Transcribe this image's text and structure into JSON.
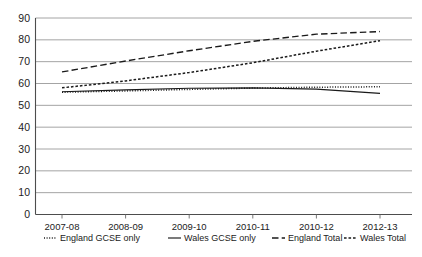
{
  "chart_data": {
    "type": "line",
    "title": "",
    "xlabel": "",
    "ylabel": "",
    "ylim": [
      0,
      90
    ],
    "ytick_step": 10,
    "grid": true,
    "legend_position": "bottom",
    "categories": [
      "2007-08",
      "2008-09",
      "2009-10",
      "2010-11",
      "2010-12",
      "2012-13"
    ],
    "ytick_labels": [
      "90",
      "80",
      "70",
      "60",
      "50",
      "40",
      "30",
      "20",
      "10",
      "0"
    ],
    "ytick_values": [
      90,
      80,
      70,
      60,
      50,
      40,
      30,
      20,
      10,
      0
    ],
    "series": [
      {
        "name": "England GCSE only",
        "style": "dotted",
        "values": [
          56.0,
          56.6,
          57.3,
          57.9,
          58.3,
          58.5
        ]
      },
      {
        "name": "Wales GCSE only",
        "style": "solid",
        "values": [
          56.2,
          57.1,
          57.8,
          58.0,
          57.4,
          55.5
        ]
      },
      {
        "name": "England Total",
        "style": "long-dash",
        "values": [
          65.3,
          70.3,
          75.0,
          79.3,
          82.6,
          83.8
        ]
      },
      {
        "name": "Wales Total",
        "style": "short-dash",
        "values": [
          58.0,
          61.2,
          65.0,
          69.5,
          74.8,
          79.6
        ]
      }
    ]
  },
  "legend": {
    "entries": [
      {
        "label": "England GCSE only",
        "style": "dotted"
      },
      {
        "label": "Wales GCSE only",
        "style": "solid"
      },
      {
        "label": "England Total",
        "style": "long-dash"
      },
      {
        "label": "Wales Total",
        "style": "short-dash"
      }
    ]
  }
}
